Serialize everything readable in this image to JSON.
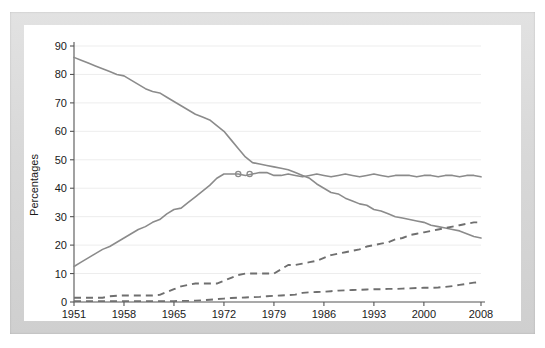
{
  "chart_data": {
    "type": "line",
    "title": "",
    "xlabel": "",
    "ylabel": "Percentages",
    "xlim": [
      1951,
      2008
    ],
    "ylim": [
      0,
      90
    ],
    "ytick_values": [
      0,
      10,
      20,
      30,
      40,
      50,
      60,
      70,
      80,
      90
    ],
    "ytick_labels": [
      "0",
      "10",
      "20",
      "30",
      "40",
      "50",
      "60",
      "70",
      "80",
      "90"
    ],
    "xtick_values": [
      1951,
      1958,
      1965,
      1972,
      1979,
      1986,
      1993,
      2000,
      2008
    ],
    "xtick_labels": [
      "1951",
      "1958",
      "1965",
      "1972",
      "1979",
      "1986",
      "1993",
      "2000",
      "2008"
    ],
    "grid": true,
    "grid_axis": "y",
    "legend": "none",
    "line_color": "#8b8b8b",
    "dash_color": "#6f6f6f",
    "x": [
      1951,
      1952,
      1953,
      1954,
      1955,
      1956,
      1957,
      1958,
      1959,
      1960,
      1961,
      1962,
      1963,
      1964,
      1965,
      1966,
      1967,
      1968,
      1969,
      1970,
      1971,
      1972,
      1973,
      1974,
      1975,
      1976,
      1977,
      1978,
      1979,
      1980,
      1981,
      1982,
      1983,
      1984,
      1985,
      1986,
      1987,
      1988,
      1989,
      1990,
      1991,
      1992,
      1993,
      1994,
      1995,
      1996,
      1997,
      1998,
      1999,
      2000,
      2001,
      2002,
      2003,
      2004,
      2005,
      2006,
      2007,
      2008
    ],
    "series": [
      {
        "name": "declining-solid",
        "style": "solid",
        "values": [
          86,
          85,
          84,
          83,
          82,
          81,
          80,
          79.5,
          78,
          76.5,
          75,
          74,
          73.5,
          72,
          70.5,
          69,
          67.5,
          66,
          65,
          64,
          62,
          60,
          57,
          54,
          51,
          49,
          48.5,
          48,
          47.5,
          47,
          46.5,
          45.5,
          44.5,
          43.5,
          41.5,
          40,
          38.5,
          38,
          36.5,
          35.5,
          34.5,
          34,
          32.5,
          32,
          31,
          30,
          29.5,
          29,
          28.5,
          28,
          27,
          26.5,
          26,
          25.5,
          25,
          24,
          23,
          22.5
        ]
      },
      {
        "name": "rising-solid",
        "style": "solid",
        "values": [
          12.5,
          14,
          15.5,
          17,
          18.5,
          19.5,
          21,
          22.5,
          24,
          25.5,
          26.5,
          28,
          29,
          31,
          32.5,
          33,
          35,
          37,
          39,
          41,
          43.5,
          45,
          45,
          45,
          44.5,
          45,
          45.5,
          45.5,
          44.5,
          44.5,
          45,
          44.5,
          44,
          44.5,
          45,
          44.5,
          44,
          44.5,
          45,
          44.5,
          44,
          44.5,
          45,
          44.5,
          44,
          44.5,
          44.5,
          44.5,
          44,
          44.5,
          44.5,
          44,
          44.5,
          44.5,
          44,
          44.5,
          44.5,
          44
        ]
      },
      {
        "name": "upper-dashed",
        "style": "dashed",
        "values": [
          1.5,
          1.5,
          1.5,
          1.5,
          1.5,
          2,
          2.2,
          2.3,
          2.3,
          2.3,
          2.3,
          2.3,
          2.5,
          3.5,
          4.5,
          5.5,
          6,
          6.5,
          6.5,
          6.5,
          6.5,
          7.5,
          8.5,
          9.5,
          10,
          10,
          10,
          10,
          10,
          11.5,
          13,
          13,
          13.5,
          14,
          14.5,
          15.5,
          16.5,
          17,
          17.5,
          18,
          18.5,
          19.5,
          20,
          20.5,
          21,
          22,
          22.5,
          23.5,
          24,
          24.5,
          25,
          25.5,
          26,
          26.5,
          27,
          27.5,
          28,
          28
        ]
      },
      {
        "name": "lower-dashed",
        "style": "dashed",
        "values": [
          0.3,
          0.3,
          0.3,
          0.3,
          0.3,
          0.3,
          0.3,
          0.3,
          0.3,
          0.3,
          0.3,
          0.3,
          0.3,
          0.3,
          0.3,
          0.4,
          0.4,
          0.5,
          0.6,
          0.8,
          1,
          1.2,
          1.4,
          1.5,
          1.6,
          1.7,
          1.8,
          2,
          2.2,
          2.3,
          2.4,
          2.6,
          3.2,
          3.4,
          3.5,
          3.6,
          3.8,
          4,
          4.1,
          4.2,
          4.3,
          4.4,
          4.5,
          4.5,
          4.6,
          4.6,
          4.7,
          4.8,
          4.9,
          5,
          5,
          5.1,
          5.3,
          5.6,
          6,
          6.4,
          6.8,
          7
        ]
      }
    ],
    "annotations": [
      {
        "name": "crossover-marker-1",
        "x": 1974,
        "y": 45.0
      },
      {
        "name": "crossover-marker-2",
        "x": 1975.6,
        "y": 45.0
      }
    ]
  }
}
